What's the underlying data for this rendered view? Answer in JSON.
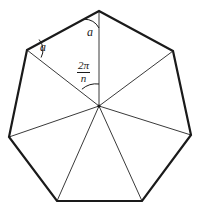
{
  "figure": {
    "name": "regular-heptagon-central-angle-diagram",
    "shape": "heptagon",
    "sides": 7,
    "colors": {
      "background": "#ffffff",
      "outline": "#1a1a1a",
      "radius_line": "#3a3a3a",
      "text": "#1a1a1a"
    },
    "geometry": {
      "center": {
        "x": 99,
        "y": 106
      },
      "vertices": [
        {
          "x": 99,
          "y": 11
        },
        {
          "x": 173,
          "y": 51
        },
        {
          "x": 191,
          "y": 135
        },
        {
          "x": 142,
          "y": 201
        },
        {
          "x": 57,
          "y": 201
        },
        {
          "x": 9,
          "y": 137
        },
        {
          "x": 27,
          "y": 50
        }
      ],
      "outline_width": 2.2,
      "radius_width": 1
    },
    "labels": {
      "angle_top": "a",
      "angle_left": "a",
      "central_angle_numerator": "2π",
      "central_angle_denominator": "n"
    },
    "arcs": [
      {
        "name": "angle-arc-top-vertex",
        "at": {
          "x": 99,
          "y": 11
        },
        "radius": 17,
        "start_deg": 90,
        "end_deg": 151
      },
      {
        "name": "angle-arc-left-vertex",
        "at": {
          "x": 27,
          "y": 50
        },
        "radius": 16,
        "start_deg": -28,
        "end_deg": 41
      },
      {
        "name": "central-angle-arc",
        "at": {
          "x": 99,
          "y": 106
        },
        "radius": 22,
        "start_deg": -90,
        "end_deg": -141
      }
    ]
  }
}
